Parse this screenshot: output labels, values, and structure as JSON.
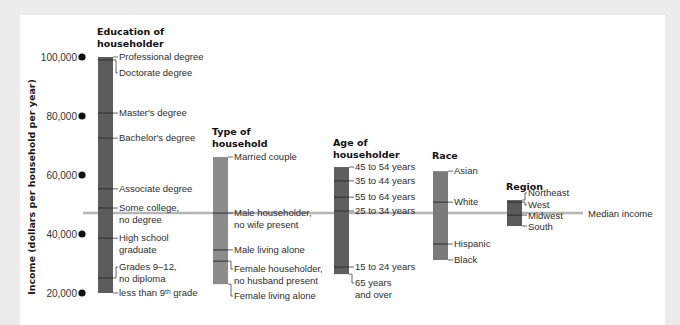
{
  "figure": {
    "median_label": "Median income"
  },
  "chart_data": {
    "type": "range-bar",
    "title": "",
    "xlabel": "",
    "ylabel": "Income (dollars per household per year)",
    "ylim": [
      20000,
      100000
    ],
    "grid": false,
    "yticks": [
      {
        "value": 100000,
        "label": "100,000"
      },
      {
        "value": 80000,
        "label": "80,000"
      },
      {
        "value": 60000,
        "label": "60,000"
      },
      {
        "value": 40000,
        "label": "40,000"
      },
      {
        "value": 20000,
        "label": "20,000"
      }
    ],
    "median_income": 47100,
    "groups": [
      {
        "title": [
          "Education of",
          "householder"
        ],
        "color": "#5c5c5c",
        "items": [
          {
            "label": [
              "Professional degree"
            ],
            "value": 100000
          },
          {
            "label": [
              "Doctorate degree"
            ],
            "value": 99000
          },
          {
            "label": [
              "Master's degree"
            ],
            "value": 81000
          },
          {
            "label": [
              "Bachelor's degree"
            ],
            "value": 72500
          },
          {
            "label": [
              "Associate degree"
            ],
            "value": 55300
          },
          {
            "label": [
              "Some college,",
              "no degree"
            ],
            "value": 48800
          },
          {
            "label": [
              "High school",
              "graduate"
            ],
            "value": 38600
          },
          {
            "label": [
              "Grades 9–12,",
              "no diploma"
            ],
            "value": 25100
          },
          {
            "label": [
              "less than 9ᵗʰ grade"
            ],
            "value": 20000
          }
        ]
      },
      {
        "title": [
          "Type of",
          "household"
        ],
        "color": "#8c8c8c",
        "items": [
          {
            "label": [
              "Married couple"
            ],
            "value": 66100
          },
          {
            "label": [
              "Male householder,",
              "no wife present"
            ],
            "value": 47100
          },
          {
            "label": [
              "Male living alone"
            ],
            "value": 34600
          },
          {
            "label": [
              "Female householder,",
              "no husband present"
            ],
            "value": 30800
          },
          {
            "label": [
              "Female living alone"
            ],
            "value": 23000
          }
        ]
      },
      {
        "title": [
          "Age of",
          "householder"
        ],
        "color": "#5e5e5e",
        "items": [
          {
            "label": [
              "45 to 54 years"
            ],
            "value": 62700
          },
          {
            "label": [
              "35 to 44 years"
            ],
            "value": 58000
          },
          {
            "label": [
              "55 to 64 years"
            ],
            "value": 52500
          },
          {
            "label": [
              "25 to 34 years"
            ],
            "value": 47800
          },
          {
            "label": [
              "15 to 24 years"
            ],
            "value": 28800
          },
          {
            "label": [
              "65 years",
              "and over"
            ],
            "value": 26400
          }
        ]
      },
      {
        "title": [
          "Race"
        ],
        "color": "#7b7b7b",
        "items": [
          {
            "label": [
              "Asian"
            ],
            "value": 61300
          },
          {
            "label": [
              "White"
            ],
            "value": 50800
          },
          {
            "label": [
              "Hispanic"
            ],
            "value": 36600
          },
          {
            "label": [
              "Black"
            ],
            "value": 31200
          }
        ]
      },
      {
        "title": [
          "Region"
        ],
        "color": "#595959",
        "items": [
          {
            "label": [
              "Northeast"
            ],
            "value": 51500
          },
          {
            "label": [
              "West"
            ],
            "value": 50800
          },
          {
            "label": [
              "Midwest"
            ],
            "value": 46400
          },
          {
            "label": [
              "South"
            ],
            "value": 42700
          }
        ]
      }
    ]
  },
  "layout": {
    "y_top": 57,
    "y_bottom": 293,
    "dot_x": 82,
    "tick_label_x": 77,
    "median_x1": 83,
    "median_x2": 583,
    "median_label_x": 588,
    "ylabel_x": 31,
    "ylabel_y": 187,
    "bar_width": 15,
    "groups": [
      {
        "key": "education",
        "x": 98,
        "title_y": 31,
        "label_y": [
          57,
          73,
          113,
          138,
          189,
          208,
          238,
          267,
          293
        ]
      },
      {
        "key": "type-of-household",
        "x": 213,
        "title_y": 131,
        "label_y": [
          157,
          213,
          250,
          269,
          296
        ]
      },
      {
        "key": "age",
        "x": 334,
        "title_y": 142,
        "label_y": [
          167,
          181,
          197,
          211,
          267,
          283
        ]
      },
      {
        "key": "race",
        "x": 433,
        "title_y": 155,
        "label_y": [
          171,
          202,
          244,
          260
        ]
      },
      {
        "key": "region",
        "x": 507,
        "title_y": 186,
        "label_y": [
          193,
          205,
          216,
          227
        ]
      }
    ]
  }
}
